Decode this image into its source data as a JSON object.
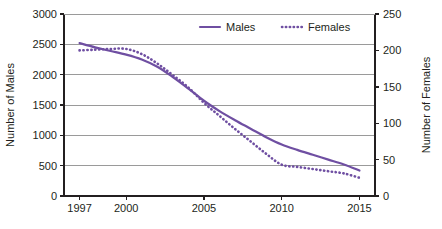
{
  "chart_data": {
    "type": "line",
    "title": "",
    "xlabel": "",
    "ylabel": "Number of Males",
    "y2label": "Number of Females",
    "grid": true,
    "legend_position": "top-center",
    "xlim": [
      1996,
      2016
    ],
    "ylim": [
      0,
      3000
    ],
    "y2lim": [
      0,
      250
    ],
    "xticks": [
      1997,
      2000,
      2005,
      2010,
      2015
    ],
    "xtick_labels": [
      "1997",
      "2000",
      "2005",
      "2010",
      "2015"
    ],
    "yticks": [
      0,
      500,
      1000,
      1500,
      2000,
      2500,
      3000
    ],
    "ytick_labels": [
      "0",
      "500",
      "1000",
      "1500",
      "2000",
      "2500",
      "3000"
    ],
    "y2ticks": [
      0,
      50,
      100,
      150,
      200,
      250
    ],
    "y2tick_labels": [
      "0",
      "50",
      "100",
      "150",
      "200",
      "250"
    ],
    "x": [
      1997,
      1998,
      1999,
      2000,
      2001,
      2002,
      2003,
      2004,
      2005,
      2006,
      2007,
      2008,
      2009,
      2010,
      2011,
      2012,
      2013,
      2014,
      2015
    ],
    "series": [
      {
        "name": "Males",
        "axis": "left",
        "style": "solid",
        "color": "#6f4fa2",
        "values": [
          2520,
          2450,
          2390,
          2330,
          2250,
          2130,
          1960,
          1770,
          1570,
          1400,
          1250,
          1110,
          970,
          850,
          760,
          680,
          600,
          520,
          420
        ]
      },
      {
        "name": "Females",
        "axis": "right",
        "style": "dotted",
        "color": "#6f4fa2",
        "values": [
          200,
          201,
          202,
          202,
          195,
          182,
          166,
          149,
          128,
          110,
          92,
          75,
          58,
          43,
          40,
          37,
          34,
          31,
          25
        ]
      }
    ]
  },
  "legend": {
    "items": [
      {
        "label": "Males",
        "style": "solid",
        "color": "#6f4fa2"
      },
      {
        "label": "Females",
        "style": "dotted",
        "color": "#6f4fa2"
      }
    ]
  },
  "colors": {
    "series": "#6f4fa2",
    "axis": "#231f20",
    "grid": "#9a9a9a",
    "text": "#231f20",
    "background": "#ffffff"
  }
}
